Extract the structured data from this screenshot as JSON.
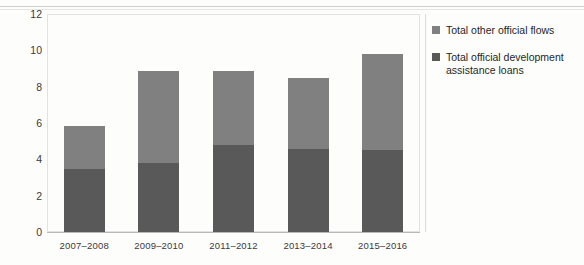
{
  "chart_data": {
    "type": "bar",
    "subtype": "stacked-vertical",
    "title": "",
    "subtitle": "",
    "xlabel": "",
    "ylabel": "",
    "ylim": [
      0,
      12
    ],
    "yticks": [
      "0",
      "2",
      "4",
      "6",
      "8",
      "10",
      "12"
    ],
    "grid": false,
    "legend_position": "right",
    "categories": [
      "2007–2008",
      "2009–2010",
      "2011–2012",
      "2013–2014",
      "2015–2016"
    ],
    "series": [
      {
        "name": "Total official development assistance loans",
        "color": "#595959",
        "values": [
          3.45,
          3.8,
          4.8,
          4.55,
          4.5
        ]
      },
      {
        "name": "Total other official flows",
        "color": "#808080",
        "values": [
          2.4,
          5.05,
          4.05,
          3.95,
          5.3
        ]
      }
    ],
    "totals": [
      5.85,
      8.85,
      8.85,
      8.5,
      9.8
    ]
  },
  "legend": {
    "items": [
      {
        "label": "Total other official flows",
        "swatch": "other"
      },
      {
        "label": "Total official development assistance loans",
        "swatch": "oda"
      }
    ]
  },
  "colors": {
    "series_other_official_flows": "#808080",
    "series_oda_loans": "#595959",
    "axis": "#b8b8b8",
    "frame": "#e2e2e2",
    "text": "#3a3a3a",
    "background": "#fdfdfc"
  }
}
